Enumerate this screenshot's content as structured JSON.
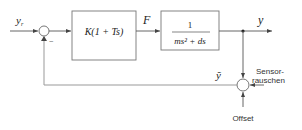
{
  "diagram": {
    "type": "control-loop block diagram",
    "signals": {
      "reference": "y",
      "reference_sub": "r",
      "control_force": "F",
      "output": "y",
      "measured": "ỹ"
    },
    "blocks": [
      {
        "id": "controller",
        "label": "K(1 + Ts)"
      },
      {
        "id": "plant",
        "numerator": "1",
        "denominator": "ms² + ds"
      }
    ],
    "summing_junctions": [
      {
        "id": "error_sum",
        "sign_feedback": "−"
      },
      {
        "id": "sensor_sum"
      }
    ],
    "disturbances": {
      "sensor_noise_line1": "Sensor-",
      "sensor_noise_line2": "rauschen",
      "offset": "Offset"
    },
    "colors": {
      "lines": "#555555",
      "feedback": "#999999",
      "box_border": "#777777"
    }
  }
}
